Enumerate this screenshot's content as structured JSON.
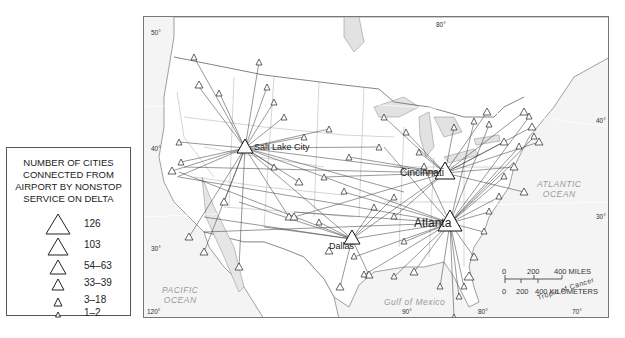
{
  "legend": {
    "title_lines": [
      "NUMBER OF CITIES",
      "CONNECTED FROM",
      "AIRPORT BY NONSTOP",
      "SERVICE ON DELTA"
    ],
    "entries": [
      {
        "label": "126",
        "size": 22
      },
      {
        "label": "103",
        "size": 18
      },
      {
        "label": "54–63",
        "size": 14
      },
      {
        "label": "33–39",
        "size": 11
      },
      {
        "label": "3–18",
        "size": 7
      },
      {
        "label": "1–2",
        "size": 5
      }
    ]
  },
  "map": {
    "hubs": [
      {
        "name": "Salt Lake City",
        "x": 101,
        "y": 131,
        "size": 14
      },
      {
        "name": "Cincinnati",
        "x": 301,
        "y": 156,
        "size": 18
      },
      {
        "name": "Atlanta",
        "x": 306,
        "y": 206,
        "size": 22
      },
      {
        "name": "Dallas",
        "x": 208,
        "y": 222,
        "size": 14
      }
    ],
    "water_labels": {
      "pacific": [
        "PACIFIC",
        "OCEAN"
      ],
      "atlantic": [
        "ATLANTIC",
        "OCEAN"
      ],
      "gulf": "Gulf of Mexico",
      "tropic": "Tropic of Cancer"
    },
    "graticule": {
      "lat_50": "50°",
      "lat_40_w": "40°",
      "lat_30_w": "30°",
      "lat_40_e": "40°",
      "lat_30_e": "30°",
      "lon_120": "120°",
      "lon_90": "90°",
      "lon_80_top": "80°",
      "lon_80_bottom": "80°",
      "lon_70": "70°"
    },
    "scale_bar": {
      "miles_ticks": [
        "0",
        "200",
        "400 MILES"
      ],
      "km_ticks": [
        "0",
        "200",
        "400 KILOMETERS"
      ]
    }
  }
}
